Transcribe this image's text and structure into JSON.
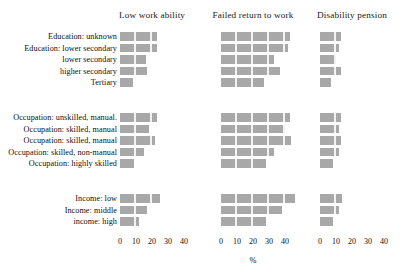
{
  "chart_data": {
    "type": "bar",
    "title": "",
    "xlabel": "%",
    "ylabel": "",
    "grid": false,
    "legend": "none",
    "orientation": "horizontal",
    "panels": [
      {
        "name": "Low work ability",
        "xlim": [
          0,
          40
        ],
        "ticks": [
          0,
          10,
          20,
          30,
          40
        ]
      },
      {
        "name": "Failed return to work",
        "xlim": [
          0,
          40
        ],
        "ticks": [
          0,
          10,
          20,
          30,
          40
        ]
      },
      {
        "name": "Disability pension",
        "xlim": [
          0,
          40
        ],
        "ticks": [
          0,
          10,
          20,
          30,
          40
        ]
      }
    ],
    "categories": [
      "Education: unknown",
      "Education: lower secondary",
      "lower secondary",
      "higher secondary",
      "Tertiary",
      "Occupation: unskilled, manual.",
      "Occupation: skilled, manual",
      "Occupation: skilled, manual",
      "Occupation: skilled, non-manual",
      "Occupation: highly skilled",
      "Income: low",
      "Income: middle",
      "income: high"
    ],
    "groups": [
      {
        "label": "Education",
        "rows": [
          0,
          1,
          2,
          3,
          4
        ]
      },
      {
        "label": "Occupation",
        "rows": [
          5,
          6,
          7,
          8,
          9
        ]
      },
      {
        "label": "Income",
        "rows": [
          10,
          11,
          12
        ]
      }
    ],
    "series": [
      {
        "name": "Low work ability",
        "values": [
          23,
          23,
          16,
          17,
          8,
          23,
          18,
          22,
          15,
          9,
          25,
          17,
          12
        ]
      },
      {
        "name": "Failed return to work",
        "values": [
          43,
          42,
          33,
          37,
          27,
          43,
          40,
          44,
          33,
          28,
          46,
          38,
          28
        ]
      },
      {
        "name": "Disability pension",
        "values": [
          13,
          12,
          10,
          13,
          7,
          13,
          12,
          13,
          12,
          8,
          14,
          12,
          8
        ]
      }
    ],
    "bar_color": "#a8a8a8"
  },
  "axis_label": "%"
}
